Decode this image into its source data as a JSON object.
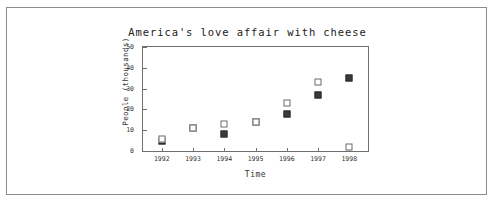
{
  "chart_data": {
    "type": "scatter",
    "title": "America's love affair with cheese",
    "xlabel": "Time",
    "ylabel": "People (thousands)",
    "categories": [
      "1992",
      "1993",
      "1994",
      "1995",
      "1996",
      "1997",
      "1998"
    ],
    "x": [
      1992,
      1993,
      1994,
      1995,
      1996,
      1997,
      1998
    ],
    "xlim": [
      1991.4,
      1998.6
    ],
    "ylim": [
      0,
      50
    ],
    "yticks": [
      0,
      10,
      20,
      30,
      40,
      50
    ],
    "ytick_labels": [
      "0",
      "10",
      "20",
      "30",
      "40",
      "50"
    ],
    "grid": false,
    "legend": "none",
    "series": [
      {
        "name": "filled-square-series",
        "marker": "filled-square",
        "color": "#3a3a3a",
        "values": [
          5,
          11,
          8,
          14,
          18,
          27,
          35
        ]
      },
      {
        "name": "open-square-series",
        "marker": "open-square",
        "color": "#ffffff",
        "values": [
          6,
          11,
          13,
          14,
          23,
          33,
          2
        ]
      }
    ]
  }
}
